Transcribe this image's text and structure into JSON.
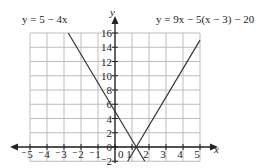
{
  "chart_data": {
    "type": "line",
    "title": "",
    "xlabel": "x",
    "ylabel": "y",
    "xlim": [
      -5,
      5
    ],
    "ylim": [
      -2,
      16
    ],
    "grid": true,
    "x_ticks": [
      "-5",
      "-4",
      "-3",
      "-2",
      "-1",
      "0",
      "1",
      "2",
      "3",
      "4",
      "5"
    ],
    "y_ticks": [
      "-2",
      "0",
      "2",
      "4",
      "6",
      "8",
      "10",
      "12",
      "14",
      "16"
    ],
    "series": [
      {
        "name": "y = 5 - 4x",
        "equation": "y = 5 − 4x",
        "points": [
          [
            -2.75,
            16
          ],
          [
            1.75,
            -2
          ]
        ]
      },
      {
        "name": "y = 9x - 5(x - 3) - 20",
        "equation": "y = 9x − 5(x − 3) − 20",
        "points": [
          [
            0.75,
            -2
          ],
          [
            5,
            15
          ]
        ]
      }
    ],
    "intersection": [
      1.25,
      0
    ]
  },
  "labels": {
    "x_axis": "x",
    "y_axis": "y",
    "eq1": "y = 5 − 4x",
    "eq2": "y = 9x − 5(x − 3) − 20"
  },
  "colors": {
    "grid": "#bdbdbd",
    "axis": "#222222",
    "line": "#333333"
  }
}
